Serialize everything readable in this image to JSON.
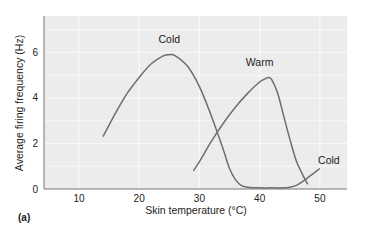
{
  "chart_data": {
    "type": "line",
    "title": "",
    "xlabel": "Skin temperature (°C)",
    "ylabel": "Average firing frequency (Hz)",
    "xlim": [
      4.2,
      54.5
    ],
    "ylim": [
      0,
      7.6
    ],
    "xticks": [
      10,
      20,
      30,
      40,
      50
    ],
    "yticks": [
      0,
      2,
      4,
      6
    ],
    "grid": true,
    "legend": "none (curves labeled inline)",
    "panel_label": "(a)",
    "series": [
      {
        "name": "Cold",
        "color": "#6e6e6e",
        "x": [
          14,
          16,
          18,
          20,
          22,
          24,
          25,
          26,
          28,
          30,
          32,
          34,
          35,
          36,
          37,
          38,
          40,
          42,
          44,
          45,
          46,
          47,
          48,
          49,
          50
        ],
        "y": [
          2.3,
          3.3,
          4.2,
          4.9,
          5.5,
          5.85,
          5.9,
          5.85,
          5.4,
          4.5,
          3.2,
          1.7,
          0.9,
          0.4,
          0.15,
          0.08,
          0.05,
          0.05,
          0.05,
          0.08,
          0.15,
          0.3,
          0.5,
          0.7,
          0.9
        ]
      },
      {
        "name": "Warm",
        "color": "#6e6e6e",
        "x": [
          29,
          30,
          32,
          34,
          36,
          38,
          40,
          41,
          41.5,
          42,
          43,
          44,
          45,
          46,
          47,
          48
        ],
        "y": [
          0.8,
          1.2,
          2.1,
          2.9,
          3.6,
          4.2,
          4.7,
          4.85,
          4.9,
          4.8,
          4.2,
          3.2,
          2.2,
          1.3,
          0.7,
          0.2
        ]
      }
    ],
    "annotations": [
      {
        "text": "Cold",
        "x": 25,
        "y": 6.4
      },
      {
        "text": "Warm",
        "x": 40,
        "y": 5.4
      },
      {
        "text": "Cold",
        "x": 51.5,
        "y": 1.1
      }
    ]
  },
  "labels": {
    "xlabel": "Skin temperature (°C)",
    "ylabel": "Average firing frequency (Hz)",
    "panel": "(a)",
    "curve_cold_peak": "Cold",
    "curve_warm": "Warm",
    "curve_cold_tail": "Cold"
  },
  "colors": {
    "plot_bg": "#ececec",
    "grid": "#f8f8f8",
    "axis": "#777777",
    "curve": "#6e6e6e"
  }
}
